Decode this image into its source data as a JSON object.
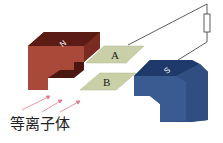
{
  "diagram": {
    "magnets": [
      {
        "label": "N",
        "color": "#7a2c22",
        "side_color": "#a9493a"
      },
      {
        "label": "S",
        "color": "#1e3a6a",
        "side_color": "#3a5a92"
      }
    ],
    "plates": [
      {
        "label": "A",
        "color": "#c9cfa7"
      },
      {
        "label": "B",
        "color": "#c9cfa7"
      }
    ],
    "circuit": {
      "component": "resistor",
      "wire_color": "#333333"
    },
    "flow": {
      "label": "等离子体",
      "arrow_color": "#e07a8a",
      "arrow_count": 3
    }
  }
}
